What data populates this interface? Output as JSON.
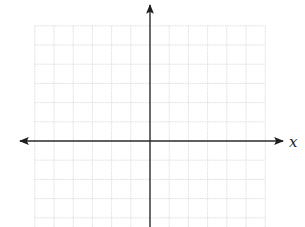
{
  "diagram": {
    "type": "coordinate-plane",
    "axes": {
      "x_label": "x",
      "y_label": "",
      "x_axis_color": "#2a2a2a",
      "y_axis_color": "#2a2a2a"
    },
    "grid": {
      "color": "#d6d6d6",
      "style": "dotted",
      "columns_left_of_origin": 6,
      "columns_right_of_origin": 6,
      "rows_above_origin": 6,
      "rows_below_origin": 4
    }
  },
  "chart_data": {
    "type": "scatter",
    "title": "",
    "xlabel": "x",
    "ylabel": "",
    "series": [],
    "grid": true,
    "legend": null
  }
}
